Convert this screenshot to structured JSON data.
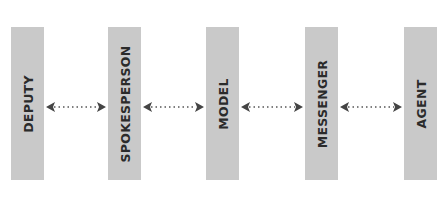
{
  "diagram": {
    "nodes": [
      {
        "id": "deputy",
        "label": "DEPUTY"
      },
      {
        "id": "spokesperson",
        "label": "SPOKESPERSON"
      },
      {
        "id": "model",
        "label": "MODEL"
      },
      {
        "id": "messenger",
        "label": "MESSENGER"
      },
      {
        "id": "agent",
        "label": "AGENT"
      }
    ],
    "edges": [
      {
        "from": "deputy",
        "to": "spokesperson",
        "style": "dotted",
        "direction": "bidirectional"
      },
      {
        "from": "spokesperson",
        "to": "model",
        "style": "dotted",
        "direction": "bidirectional"
      },
      {
        "from": "model",
        "to": "messenger",
        "style": "dotted",
        "direction": "bidirectional"
      },
      {
        "from": "messenger",
        "to": "agent",
        "style": "dotted",
        "direction": "bidirectional"
      }
    ],
    "colors": {
      "box": "#c9c9c9",
      "text": "#2b2b2b",
      "arrow": "#444444"
    }
  }
}
